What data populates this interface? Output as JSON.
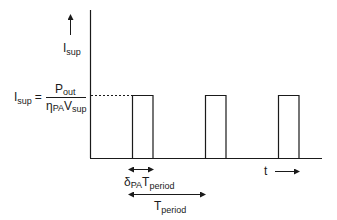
{
  "diagram": {
    "type": "pulsed-current-waveform",
    "y_axis": {
      "label_main": "I",
      "label_sub": "sup"
    },
    "x_axis": {
      "label": "t"
    },
    "level_equation": {
      "lhs_main": "I",
      "lhs_sub": "sup",
      "equals": "=",
      "numerator_main": "P",
      "numerator_sub": "out",
      "denominator_eta": "η",
      "denominator_eta_sub": "PA",
      "denominator_v": "V",
      "denominator_v_sub": "sup"
    },
    "pulse_count": 3,
    "duty_annotation": {
      "delta": "δ",
      "delta_sub": "PA",
      "t_main": "T",
      "t_sub": "period"
    },
    "period_annotation": {
      "t_main": "T",
      "t_sub": "period"
    },
    "line_color": "#1a1a1a",
    "background": "#ffffff"
  }
}
